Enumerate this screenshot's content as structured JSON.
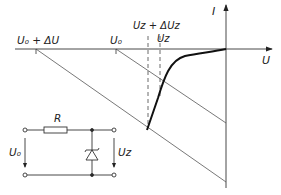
{
  "graph": {
    "axes": {
      "y_label": "I",
      "x_label": "U"
    },
    "markers": {
      "u0_plus_du": "U₀ + ΔU",
      "u0": "U₀",
      "uz_plus_duz": "Uᴢ + ΔUᴢ",
      "uz": "Uᴢ"
    }
  },
  "circuit": {
    "resistor_label": "R",
    "input_voltage": "U₀",
    "output_voltage": "Uᴢ"
  },
  "colors": {
    "line": "#333333",
    "curve": "#111111"
  }
}
